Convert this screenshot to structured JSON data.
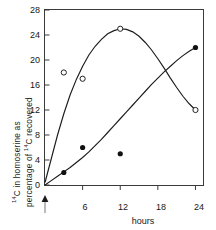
{
  "figure": {
    "name": "homoserine-14c-timecourse"
  },
  "axes": {
    "y_label_line1_pre": "14",
    "y_label_line1": "C in homoserine as",
    "y_label_line2_pre": "percentage of ",
    "y_label_line2_sup": "14",
    "y_label_line2_post": "C recovered",
    "x_label": "hours",
    "y_ticks": [
      0,
      4,
      8,
      12,
      16,
      20,
      24,
      28
    ],
    "y_tick_labels": [
      "0",
      "4",
      "8",
      "12",
      "16",
      "20",
      "24",
      "28"
    ],
    "x_ticks": [
      0,
      6,
      12,
      18,
      24
    ],
    "x_tick_labels": [
      "",
      "6",
      "12",
      "18",
      "24"
    ],
    "ylim": [
      0,
      28
    ],
    "xlim": [
      0,
      25.2
    ],
    "grid": false,
    "frame": "box"
  },
  "annotations": {
    "origin_arrow": "up-arrow-marker-at-zero-hours"
  },
  "chart_data": {
    "type": "line",
    "title": "",
    "subtitle": "",
    "xlabel": "hours",
    "ylabel": "14C in homoserine as percentage of 14C recovered",
    "xlim": [
      0,
      25.2
    ],
    "ylim": [
      0,
      28
    ],
    "grid": false,
    "legend": "none",
    "series": [
      {
        "name": "open-circle-series",
        "marker": "open-circle",
        "color": "#222222",
        "x": [
          3,
          6,
          12,
          24
        ],
        "y": [
          18,
          17,
          25,
          12
        ],
        "curve_points": [
          [
            0,
            0.4
          ],
          [
            1,
            4.2
          ],
          [
            2,
            8.0
          ],
          [
            3,
            11.4
          ],
          [
            4,
            14.4
          ],
          [
            5,
            16.9
          ],
          [
            6,
            19.0
          ],
          [
            7,
            20.8
          ],
          [
            8,
            22.2
          ],
          [
            9,
            23.3
          ],
          [
            10,
            24.2
          ],
          [
            11,
            24.7
          ],
          [
            12,
            25.0
          ],
          [
            13,
            24.9
          ],
          [
            14,
            24.5
          ],
          [
            15,
            23.8
          ],
          [
            16,
            22.8
          ],
          [
            17,
            21.6
          ],
          [
            18,
            20.2
          ],
          [
            19,
            18.7
          ],
          [
            20,
            17.1
          ],
          [
            21,
            15.6
          ],
          [
            22,
            14.2
          ],
          [
            23,
            13.0
          ],
          [
            24,
            12.0
          ]
        ]
      },
      {
        "name": "filled-circle-series",
        "marker": "filled-circle",
        "color": "#111111",
        "x": [
          3,
          6,
          12,
          24
        ],
        "y": [
          2,
          6,
          5,
          22
        ],
        "curve_points": [
          [
            0,
            0.0
          ],
          [
            1,
            0.7
          ],
          [
            2,
            1.4
          ],
          [
            3,
            2.1
          ],
          [
            4,
            2.8
          ],
          [
            5,
            3.6
          ],
          [
            6,
            4.4
          ],
          [
            7,
            5.3
          ],
          [
            8,
            6.3
          ],
          [
            9,
            7.3
          ],
          [
            10,
            8.4
          ],
          [
            11,
            9.5
          ],
          [
            12,
            10.6
          ],
          [
            13,
            11.7
          ],
          [
            14,
            12.8
          ],
          [
            15,
            13.9
          ],
          [
            16,
            15.0
          ],
          [
            17,
            16.1
          ],
          [
            18,
            17.1
          ],
          [
            19,
            18.1
          ],
          [
            20,
            19.0
          ],
          [
            21,
            19.9
          ],
          [
            22,
            20.7
          ],
          [
            23,
            21.4
          ],
          [
            24,
            22.0
          ]
        ]
      }
    ]
  }
}
